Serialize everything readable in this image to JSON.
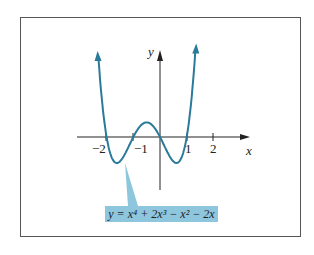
{
  "chart_data": {
    "type": "line",
    "title": "",
    "xlabel": "x",
    "ylabel": "y",
    "x_ticks": [
      "-2",
      "-1",
      "1",
      "2"
    ],
    "xlim": [
      -2.35,
      3.3
    ],
    "ylim": [
      -2.0,
      3.3
    ],
    "grid": false,
    "legend": "none",
    "series": [
      {
        "name": "y = x^4 + 2x^3 - x^2 - 2x",
        "function": "x^4 + 2x^3 - x^2 - 2x",
        "color": "#2a7a9a",
        "x": [
          -2.3,
          -2.0,
          -1.8,
          -1.62,
          -1.4,
          -1.0,
          -0.6,
          -0.3,
          0.0,
          0.3,
          0.62,
          0.8,
          1.0,
          1.3
        ],
        "y": [
          3.1,
          0.0,
          -0.7,
          -1.0,
          -0.9,
          0.0,
          0.6,
          0.4,
          0.0,
          -0.6,
          -1.0,
          -0.8,
          0.0,
          3.4
        ]
      }
    ],
    "annotations": [
      "y = x⁴ + 2x³ − x² − 2x"
    ]
  },
  "labels": {
    "x_axis": "x",
    "y_axis": "y",
    "tick_m2": "−2",
    "tick_m1": "−1",
    "tick_1": "1",
    "tick_2": "2",
    "equation": "y = x⁴ + 2x³ − x² − 2x"
  },
  "colors": {
    "curve": "#2a7a9a",
    "label_bg": "#8ec6de",
    "axis": "#222222"
  }
}
